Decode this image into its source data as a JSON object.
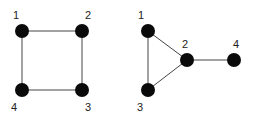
{
  "graphs": [
    {
      "name": "square-graph",
      "nodes": [
        {
          "id": "1",
          "label": "1",
          "x": 22,
          "y": 31,
          "lx": 13,
          "ly": 19
        },
        {
          "id": "2",
          "label": "2",
          "x": 82,
          "y": 31,
          "lx": 85,
          "ly": 19
        },
        {
          "id": "3",
          "label": "3",
          "x": 82,
          "y": 90,
          "lx": 85,
          "ly": 111
        },
        {
          "id": "4",
          "label": "4",
          "x": 22,
          "y": 90,
          "lx": 11,
          "ly": 111
        }
      ],
      "edges": [
        [
          "1",
          "2"
        ],
        [
          "2",
          "3"
        ],
        [
          "3",
          "4"
        ],
        [
          "4",
          "1"
        ]
      ]
    },
    {
      "name": "triangle-tail-graph",
      "nodes": [
        {
          "id": "1",
          "label": "1",
          "x": 148,
          "y": 31,
          "lx": 138,
          "ly": 19
        },
        {
          "id": "2",
          "label": "2",
          "x": 187,
          "y": 60,
          "lx": 182,
          "ly": 48
        },
        {
          "id": "3",
          "label": "3",
          "x": 148,
          "y": 90,
          "lx": 137,
          "ly": 111
        },
        {
          "id": "4",
          "label": "4",
          "x": 234,
          "y": 60,
          "lx": 233,
          "ly": 48
        }
      ],
      "edges": [
        [
          "1",
          "2"
        ],
        [
          "1",
          "3"
        ],
        [
          "2",
          "3"
        ],
        [
          "2",
          "4"
        ]
      ]
    }
  ],
  "style": {
    "node_color": "#0a0a0a",
    "edge_color": "#444444",
    "node_radius": 7
  }
}
